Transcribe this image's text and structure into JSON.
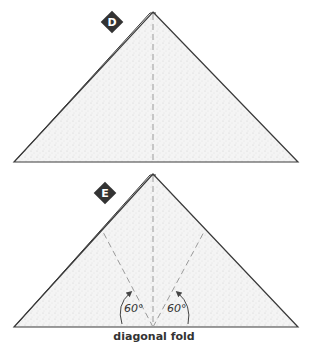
{
  "steps": [
    {
      "badge": "D"
    },
    {
      "badge": "E",
      "angles": [
        "60°",
        "60°"
      ],
      "caption": "diagonal fold"
    }
  ],
  "colors": {
    "paper_fill": "#f1f1f1",
    "outline": "#3a3a3a",
    "dash": "#9a9a9a",
    "badge_bg": "#333333",
    "badge_text": "#ffffff"
  }
}
